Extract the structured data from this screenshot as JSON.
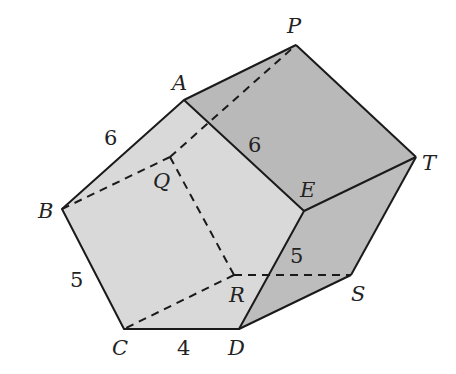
{
  "figure": {
    "type": "pentagonal prism",
    "colors": {
      "front_face": "#d9d9d9",
      "top_face": "#b9b9b9",
      "side_face": "#bdbdbd",
      "bottom_face": "#c4c4c4",
      "edge": "#1a1a1a"
    },
    "vertices": {
      "A": {
        "label": "A"
      },
      "B": {
        "label": "B"
      },
      "C": {
        "label": "C"
      },
      "D": {
        "label": "D"
      },
      "E": {
        "label": "E"
      },
      "P": {
        "label": "P"
      },
      "Q": {
        "label": "Q"
      },
      "R": {
        "label": "R"
      },
      "S": {
        "label": "S"
      },
      "T": {
        "label": "T"
      }
    },
    "edge_lengths": {
      "AB": "6",
      "AE": "6",
      "BC": "5",
      "CD": "4",
      "ES": "5"
    }
  }
}
